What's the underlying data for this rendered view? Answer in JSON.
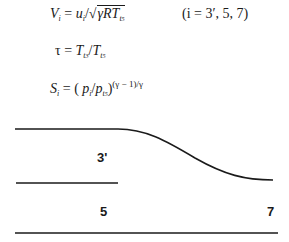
{
  "equations": {
    "velocity": {
      "lhs": "V",
      "lhs_sub": "i",
      "rhs_num": "u",
      "rhs_num_sub": "i",
      "rhs_den": "γRT",
      "rhs_den_sub": "t",
      "rhs_den_sub2": "5",
      "text": "V_i = u_i / √(γ R T_t5)"
    },
    "condition": "(i = 3′, 5, 7)",
    "tau": {
      "lhs": "τ",
      "num": "T",
      "num_sub": "t",
      "num_sub2": "3",
      "den": "T",
      "den_sub": "t",
      "den_sub2": "5",
      "text": "τ = T_t3 / T_t5"
    },
    "entropy": {
      "lhs": "S",
      "lhs_sub": "i",
      "num": "p",
      "num_sub": "i",
      "den": "p",
      "den_sub": "t",
      "den_sub2": "5",
      "exponent": "(γ − 1)/γ",
      "text": "S_i = (p_i / p_t5)^((γ−1)/γ)"
    }
  },
  "diagram": {
    "stations": [
      {
        "label": "3'",
        "x": 97,
        "y": 152
      },
      {
        "label": "5",
        "x": 100,
        "y": 205
      },
      {
        "label": "7",
        "x": 267,
        "y": 205
      }
    ],
    "stroke_color": "#1a1a1a"
  }
}
